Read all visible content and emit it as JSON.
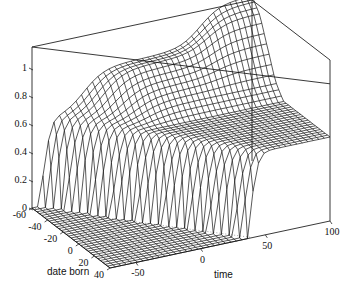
{
  "chart_data": {
    "type": "surface3d",
    "title": "",
    "axes": {
      "x": {
        "label": "date born",
        "ticks": [
          -60,
          -40,
          -20,
          0,
          20,
          40
        ],
        "range": [
          -60,
          40
        ]
      },
      "y": {
        "label": "time",
        "ticks": [
          -50,
          0,
          50,
          100
        ],
        "range": [
          -70,
          100
        ]
      },
      "z": {
        "label": "",
        "ticks": [
          0,
          0.2,
          0.4,
          0.6,
          0.8,
          1
        ],
        "range": [
          0,
          1.1
        ]
      }
    },
    "tick_labels": {
      "z": [
        "0",
        "0.2",
        "0.4",
        "0.6",
        "0.8",
        "1"
      ],
      "x": [
        "-60",
        "-40",
        "-20",
        "0",
        "20",
        "40"
      ],
      "y": [
        "-50",
        "0",
        "50",
        "100"
      ]
    },
    "grid": false,
    "color": "#000000"
  }
}
